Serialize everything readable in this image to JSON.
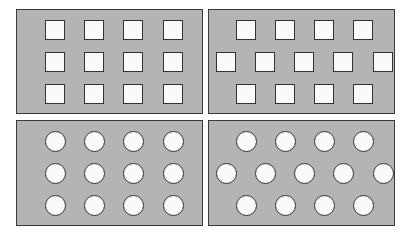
{
  "diagram": {
    "colors": {
      "panel_fill": "#b4b4b4",
      "panel_border": "#3a3a3a",
      "shape_fill": "#fafafa",
      "shape_border": "#333333"
    },
    "panels": [
      {
        "id": "squares-grid",
        "shape": "square",
        "layout": "grid",
        "rows": [
          4,
          4,
          4
        ]
      },
      {
        "id": "squares-staggered",
        "shape": "square",
        "layout": "staggered",
        "rows": [
          4,
          5,
          4
        ]
      },
      {
        "id": "circles-grid",
        "shape": "circle",
        "layout": "grid",
        "rows": [
          4,
          4,
          4
        ]
      },
      {
        "id": "circles-staggered",
        "shape": "circle",
        "layout": "staggered",
        "rows": [
          4,
          5,
          4
        ]
      }
    ]
  }
}
